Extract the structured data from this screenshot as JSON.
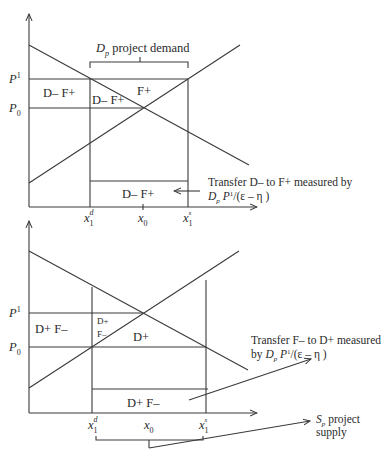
{
  "top_panel": {
    "y_labels": {
      "p1": "P",
      "p1_sup": "1",
      "p0": "P",
      "p0_sub": "0"
    },
    "x_labels": {
      "x1d": "x",
      "x1d_sub": "1",
      "x1d_sup": "d",
      "x0": "x",
      "x0_sub": "0",
      "x1s": "x",
      "x1s_sub": "1",
      "x1s_sup": "s"
    },
    "brace_label": {
      "d": "D",
      "d_sub": "p",
      "rest": " project demand"
    },
    "regions": {
      "left": "D– F+",
      "inner": "D– F+",
      "triangle": "F+",
      "bottom": "D– F+"
    },
    "note": {
      "line1": "Transfer D– to F+ measured by",
      "line2_d": "D",
      "line2_d_sub": "p",
      "line2_p": " P",
      "line2_p_sup": "1",
      "line2_rest": "/(ε – η )"
    }
  },
  "bottom_panel": {
    "y_labels": {
      "p1": "P",
      "p1_sup": "1",
      "p0": "P",
      "p0_sub": "0"
    },
    "x_labels": {
      "x1d": "x",
      "x1d_sub": "1",
      "x1d_sup": "d",
      "x0": "x",
      "x0_sub": "0",
      "x1s": "x",
      "x1s_sub": "1",
      "x1s_sup": "s"
    },
    "regions": {
      "left": "D+ F–",
      "inner_top": "D+",
      "inner_bottom": "F–",
      "triangle": "D+",
      "bottom": "D+ F–"
    },
    "note": {
      "line1": "Transfer F– to D+ measured",
      "line2_by": "by ",
      "line2_d": "D",
      "line2_d_sub": "p",
      "line2_p": " P",
      "line2_p_sup": "1",
      "line2_rest": "/(ε – η )"
    },
    "supply_label": {
      "s": "S",
      "s_sub": "p",
      "line1_rest": " project",
      "line2": "supply"
    }
  },
  "colors": {
    "line": "#3a3a3a",
    "text": "#2a2a2a",
    "background": "#ffffff"
  }
}
